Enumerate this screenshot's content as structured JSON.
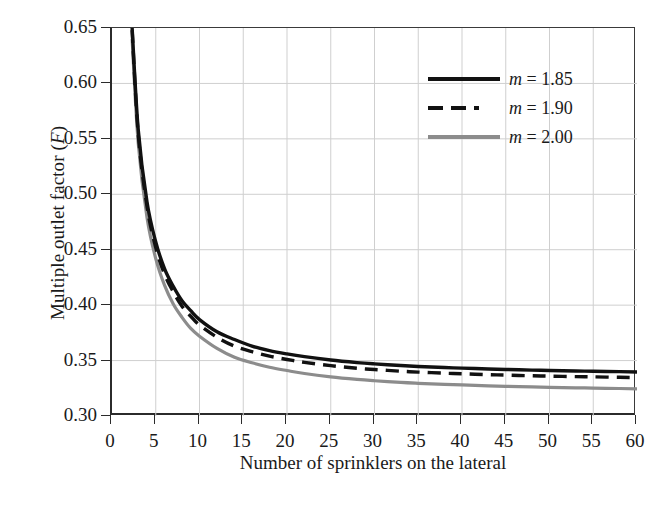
{
  "chart_data": {
    "type": "line",
    "title": "",
    "xlabel": "Number of sprinklers on the lateral",
    "ylabel": "Multiple outlet factor (F)",
    "ylabel_main": "Multiple outlet factor (",
    "ylabel_italic": "F",
    "ylabel_close": ")",
    "xlim": [
      0,
      60
    ],
    "ylim": [
      0.3,
      0.65
    ],
    "grid": true,
    "legend_position": "top-right",
    "xticks": [
      0,
      5,
      10,
      15,
      20,
      25,
      30,
      35,
      40,
      45,
      50,
      55,
      60
    ],
    "xtick_labels": [
      "0",
      "5",
      "10",
      "15",
      "20",
      "25",
      "30",
      "35",
      "40",
      "45",
      "50",
      "55",
      "60"
    ],
    "yticks": [
      0.3,
      0.35,
      0.4,
      0.45,
      0.5,
      0.55,
      0.6,
      0.65
    ],
    "ytick_labels": [
      "0.30",
      "0.35",
      "0.40",
      "0.45",
      "0.50",
      "0.55",
      "0.60",
      "0.65"
    ],
    "series": [
      {
        "name": "m = 1.85",
        "label_prefix": "m",
        "label_value": " = 1.85",
        "m": 1.85,
        "color": "#111111",
        "style": "solid",
        "width": 3.4,
        "x": [
          2.3,
          3,
          4,
          5,
          6,
          7,
          8,
          9,
          10,
          12,
          14,
          16,
          18,
          20,
          22,
          25,
          28,
          30,
          33,
          35,
          38,
          40,
          43,
          45,
          48,
          50,
          53,
          55,
          58,
          60
        ],
        "values": [
          0.65,
          0.558,
          0.493,
          0.457,
          0.433,
          0.417,
          0.404,
          0.395,
          0.387,
          0.376,
          0.369,
          0.363,
          0.359,
          0.356,
          0.3535,
          0.3505,
          0.3482,
          0.347,
          0.3455,
          0.3447,
          0.3437,
          0.3432,
          0.3424,
          0.342,
          0.3414,
          0.3411,
          0.3406,
          0.3404,
          0.34,
          0.3397
        ]
      },
      {
        "name": "m = 1.90",
        "label_prefix": "m",
        "label_value": " = 1.90",
        "m": 1.9,
        "color": "#111111",
        "style": "dashed",
        "width": 3.4,
        "x": [
          2.3,
          3,
          4,
          5,
          6,
          7,
          8,
          9,
          10,
          12,
          14,
          16,
          18,
          20,
          22,
          25,
          28,
          30,
          33,
          35,
          38,
          40,
          43,
          45,
          48,
          50,
          53,
          55,
          58,
          60
        ],
        "values": [
          0.648,
          0.554,
          0.489,
          0.452,
          0.428,
          0.412,
          0.399,
          0.39,
          0.382,
          0.371,
          0.363,
          0.358,
          0.354,
          0.351,
          0.3484,
          0.3454,
          0.3431,
          0.3419,
          0.3404,
          0.3396,
          0.3386,
          0.3381,
          0.3373,
          0.3369,
          0.3363,
          0.336,
          0.3355,
          0.3353,
          0.3349,
          0.3346
        ]
      },
      {
        "name": "m = 2.00",
        "label_prefix": "m",
        "label_value": " = 2.00",
        "m": 2.0,
        "color": "#8c8c8c",
        "style": "solid",
        "width": 3.2,
        "x": [
          2.3,
          3,
          4,
          5,
          6,
          7,
          8,
          9,
          10,
          12,
          14,
          16,
          18,
          20,
          22,
          25,
          28,
          30,
          33,
          35,
          38,
          40,
          43,
          45,
          48,
          50,
          53,
          55,
          58,
          60
        ],
        "values": [
          0.64,
          0.546,
          0.479,
          0.442,
          0.418,
          0.401,
          0.389,
          0.379,
          0.372,
          0.361,
          0.353,
          0.348,
          0.344,
          0.341,
          0.3383,
          0.3353,
          0.333,
          0.3318,
          0.3303,
          0.3295,
          0.3285,
          0.328,
          0.3272,
          0.3268,
          0.3262,
          0.3259,
          0.3254,
          0.3252,
          0.3248,
          0.3245
        ]
      }
    ]
  },
  "legend": {
    "entries": [
      {
        "swatch": "solid-black",
        "text_prefix": "m",
        "text_rest": " = 1.85"
      },
      {
        "swatch": "dashed-black",
        "text_prefix": "m",
        "text_rest": " = 1.90"
      },
      {
        "swatch": "solid-gray",
        "text_prefix": "m",
        "text_rest": " = 2.00"
      }
    ]
  },
  "caption": ""
}
